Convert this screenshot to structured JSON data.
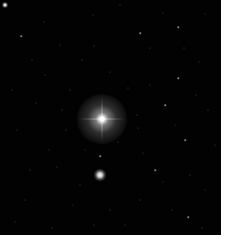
{
  "image": {
    "description": "Astronomical star field with a bright central star surrounded by a halo and a second bright star below it",
    "background_color": "#020202",
    "border_color": "#ffffff",
    "field": {
      "width": 221,
      "height": 235
    }
  },
  "bright_stars": [
    {
      "name": "primary-star",
      "x": 102,
      "y": 119,
      "halo_diameter": 50,
      "spike_length": 46
    },
    {
      "name": "secondary-star",
      "x": 100,
      "y": 175,
      "halo_diameter": 12
    },
    {
      "name": "corner-star",
      "x": 5,
      "y": 5,
      "halo_diameter": 6
    }
  ],
  "faint_stars": [
    [
      21,
      36,
      1.5
    ],
    [
      44,
      22,
      1
    ],
    [
      93,
      15,
      1
    ],
    [
      140,
      33,
      1.5
    ],
    [
      178,
      27,
      1.5
    ],
    [
      184,
      48,
      1
    ],
    [
      163,
      13,
      1
    ],
    [
      120,
      5,
      1
    ],
    [
      205,
      14,
      1
    ],
    [
      32,
      60,
      1
    ],
    [
      60,
      45,
      1
    ],
    [
      82,
      60,
      1
    ],
    [
      94,
      46,
      1
    ],
    [
      150,
      48,
      1
    ],
    [
      178,
      78,
      1.5
    ],
    [
      199,
      62,
      1
    ],
    [
      165,
      105,
      1.5
    ],
    [
      137,
      115,
      1
    ],
    [
      175,
      125,
      1
    ],
    [
      138,
      128,
      1
    ],
    [
      100,
      156,
      1.5
    ],
    [
      49,
      150,
      1
    ],
    [
      57,
      167,
      1
    ],
    [
      85,
      150,
      1
    ],
    [
      155,
      170,
      1.5
    ],
    [
      163,
      182,
      1
    ],
    [
      190,
      175,
      1
    ],
    [
      30,
      170,
      1
    ],
    [
      17,
      130,
      1
    ],
    [
      36,
      103,
      1
    ],
    [
      12,
      90,
      1
    ],
    [
      70,
      90,
      1
    ],
    [
      208,
      110,
      1
    ],
    [
      215,
      145,
      1
    ],
    [
      205,
      190,
      1
    ],
    [
      188,
      217,
      1.5
    ],
    [
      52,
      228,
      1
    ],
    [
      25,
      200,
      1
    ],
    [
      73,
      205,
      1
    ],
    [
      110,
      210,
      1
    ],
    [
      140,
      200,
      1
    ],
    [
      172,
      210,
      1
    ],
    [
      202,
      228,
      1
    ],
    [
      125,
      225,
      1
    ],
    [
      94,
      225,
      1
    ],
    [
      15,
      222,
      1
    ],
    [
      143,
      153,
      1
    ],
    [
      118,
      142,
      1
    ],
    [
      66,
      130,
      1
    ],
    [
      80,
      185,
      1
    ],
    [
      62,
      110,
      1
    ],
    [
      128,
      88,
      1
    ],
    [
      150,
      85,
      1
    ],
    [
      110,
      72,
      1
    ],
    [
      45,
      75,
      1
    ],
    [
      196,
      95,
      1
    ],
    [
      185,
      140,
      1.5
    ]
  ]
}
